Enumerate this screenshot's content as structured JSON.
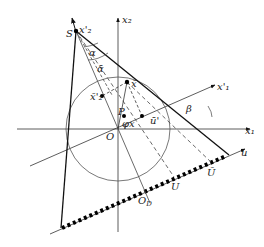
{
  "diagram": {
    "labels": {
      "S": "S",
      "x2_prime": "x'₂",
      "x2": "x₂",
      "x1": "x₁",
      "x1_prime": "x'₁",
      "alpha": "α",
      "alpha_bar": "ᾱ",
      "x_bar": "x̄",
      "x2_bar_prime": "x̄'₂",
      "P": "P",
      "phi_x": "φx",
      "u_bar_prime": "ū'",
      "beta": "β",
      "O": "O",
      "O_D": "O",
      "O_D_sub": "D",
      "U": "U",
      "U_bar": "Ū",
      "u": "u"
    }
  }
}
